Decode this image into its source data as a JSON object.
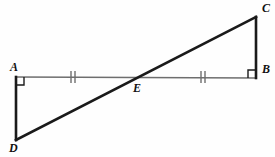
{
  "figure": {
    "width": 275,
    "height": 157,
    "background_color": "#fefefe"
  },
  "style": {
    "thick_stroke_color": "#1a1a1a",
    "thin_stroke_color": "#6e6e6e",
    "tick_color": "#6e6e6e",
    "right_angle_color": "#1a1a1a",
    "thick_stroke_width": 2.6,
    "thin_stroke_width": 1.4,
    "tick_stroke_width": 1.4
  },
  "points": {
    "A": {
      "label": "A",
      "x": 16,
      "y": 77
    },
    "B": {
      "label": "B",
      "x": 256,
      "y": 78
    },
    "C": {
      "label": "C",
      "x": 256,
      "y": 17
    },
    "D": {
      "label": "D",
      "x": 16,
      "y": 140
    },
    "E": {
      "label": "E",
      "x": 131,
      "y": 77
    }
  },
  "segments": [
    {
      "name": "segment-AB",
      "from": "A",
      "to": "B",
      "weight": "thin",
      "color": "#6e6e6e"
    },
    {
      "name": "segment-AD",
      "from": "A",
      "to": "D",
      "weight": "thick",
      "color": "#1a1a1a"
    },
    {
      "name": "segment-BC",
      "from": "B",
      "to": "C",
      "weight": "thick",
      "color": "#1a1a1a"
    },
    {
      "name": "segment-DC",
      "from": "D",
      "to": "C",
      "weight": "thick",
      "color": "#1a1a1a"
    }
  ],
  "right_angles": [
    {
      "name": "right-angle-A",
      "vertex": "A",
      "size": 8,
      "opens": "down-right"
    },
    {
      "name": "right-angle-B",
      "vertex": "B",
      "size": 8,
      "opens": "up-left"
    }
  ],
  "tick_marks": [
    {
      "name": "tick-marks-AE",
      "segment": "AE",
      "count": 2,
      "center_x": 73,
      "center_y": 77,
      "half_height": 6,
      "spacing": 4
    },
    {
      "name": "tick-marks-EB",
      "segment": "EB",
      "count": 2,
      "center_x": 203,
      "center_y": 77,
      "half_height": 6,
      "spacing": 4
    }
  ],
  "congruence_note": "AE is congruent to EB (double tick marks)"
}
